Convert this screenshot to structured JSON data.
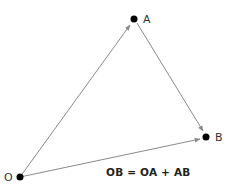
{
  "diagram": {
    "type": "vector-addition",
    "points": {
      "O": {
        "label": "O",
        "x": 20,
        "y": 177
      },
      "A": {
        "label": "A",
        "x": 134,
        "y": 19
      },
      "B": {
        "label": "B",
        "x": 206,
        "y": 137
      }
    },
    "vectors": [
      {
        "from": "O",
        "to": "A"
      },
      {
        "from": "A",
        "to": "B"
      },
      {
        "from": "O",
        "to": "B"
      }
    ],
    "equation": "OB = OA + AB",
    "colors": {
      "line": "#8a8a8a",
      "point": "#000000",
      "text": "#222222"
    }
  }
}
